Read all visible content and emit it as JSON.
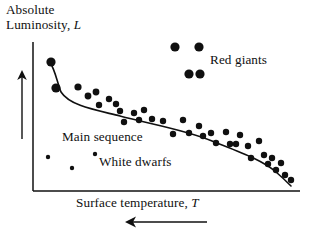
{
  "figure": {
    "kind": "hertzsprung-russell-diagram",
    "background_color": "#ffffff",
    "ink_color": "#101010"
  },
  "axes": {
    "y_title_line1": "Absolute",
    "y_title_line2": "Luminosity,",
    "y_title_symbol": "L",
    "x_title": "Surface temperature,",
    "x_title_symbol": "T",
    "y_axis_line": {
      "x": 33,
      "y1": 42,
      "y2": 191
    },
    "x_axis_line": {
      "x1": 33,
      "x2": 300,
      "y": 191
    },
    "y_direction_arrow": {
      "x": 22,
      "y_tip": 71,
      "y_tail": 139,
      "points": "up"
    },
    "x_direction_arrow": {
      "y": 222,
      "x_tip": 126,
      "x_tail": 207,
      "points": "left"
    }
  },
  "annotations": {
    "red_giants": "Red giants",
    "main_sequence": "Main sequence",
    "white_dwarfs": "White dwarfs"
  },
  "chart_data": {
    "type": "scatter",
    "title": "",
    "xlabel": "Surface temperature, T",
    "ylabel": "Absolute Luminosity, L",
    "grid": false,
    "legend": false,
    "x_axis_direction": "decreasing left-to-right (arrow points left)",
    "y_axis_direction": "increasing upward (arrow points up)",
    "xlim": [
      33,
      300
    ],
    "ylim": [
      191,
      42
    ],
    "note": "Coordinates are given in screenshot pixel space: x increases to the right, y increases downward.",
    "series": [
      {
        "name": "Main sequence",
        "marker": "filled-circle",
        "color": "#101010",
        "points": [
          {
            "x": 51,
            "y": 62,
            "r": 4.6
          },
          {
            "x": 56,
            "y": 88,
            "r": 4.6
          },
          {
            "x": 78,
            "y": 87,
            "r": 3.6
          },
          {
            "x": 88,
            "y": 96,
            "r": 3.4
          },
          {
            "x": 96,
            "y": 92,
            "r": 3.4
          },
          {
            "x": 99,
            "y": 105,
            "r": 3.2
          },
          {
            "x": 109,
            "y": 99,
            "r": 3.2
          },
          {
            "x": 116,
            "y": 104,
            "r": 3.2
          },
          {
            "x": 120,
            "y": 111,
            "r": 3.2
          },
          {
            "x": 124,
            "y": 122,
            "r": 3.2
          },
          {
            "x": 134,
            "y": 113,
            "r": 3.2
          },
          {
            "x": 139,
            "y": 120,
            "r": 3.2
          },
          {
            "x": 144,
            "y": 110,
            "r": 3.2
          },
          {
            "x": 152,
            "y": 119,
            "r": 3.2
          },
          {
            "x": 163,
            "y": 121,
            "r": 3.2
          },
          {
            "x": 173,
            "y": 134,
            "r": 3.2
          },
          {
            "x": 183,
            "y": 120,
            "r": 3.2
          },
          {
            "x": 189,
            "y": 133,
            "r": 3.2
          },
          {
            "x": 199,
            "y": 126,
            "r": 3.2
          },
          {
            "x": 203,
            "y": 136,
            "r": 3.2
          },
          {
            "x": 211,
            "y": 133,
            "r": 3.2
          },
          {
            "x": 216,
            "y": 143,
            "r": 3.2
          },
          {
            "x": 226,
            "y": 132,
            "r": 3.2
          },
          {
            "x": 230,
            "y": 144,
            "r": 3.2
          },
          {
            "x": 236,
            "y": 144,
            "r": 3.2
          },
          {
            "x": 240,
            "y": 135,
            "r": 3.2
          },
          {
            "x": 248,
            "y": 146,
            "r": 3.2
          },
          {
            "x": 251,
            "y": 158,
            "r": 3.2
          },
          {
            "x": 259,
            "y": 141,
            "r": 3.2
          },
          {
            "x": 264,
            "y": 155,
            "r": 3.2
          },
          {
            "x": 268,
            "y": 164,
            "r": 3.2
          },
          {
            "x": 272,
            "y": 158,
            "r": 3.2
          },
          {
            "x": 276,
            "y": 170,
            "r": 3.2
          },
          {
            "x": 281,
            "y": 163,
            "r": 3.2
          },
          {
            "x": 285,
            "y": 175,
            "r": 3.2
          },
          {
            "x": 291,
            "y": 180,
            "r": 3.2
          }
        ]
      },
      {
        "name": "Red giants",
        "marker": "filled-circle",
        "color": "#101010",
        "points": [
          {
            "x": 175,
            "y": 47,
            "r": 4.6
          },
          {
            "x": 199,
            "y": 47,
            "r": 4.6
          },
          {
            "x": 189,
            "y": 74,
            "r": 4.6
          },
          {
            "x": 200,
            "y": 74,
            "r": 4.6
          }
        ]
      },
      {
        "name": "White dwarfs",
        "marker": "filled-circle",
        "color": "#101010",
        "points": [
          {
            "x": 48,
            "y": 157,
            "r": 2.2
          },
          {
            "x": 95,
            "y": 154,
            "r": 2.2
          },
          {
            "x": 72,
            "y": 168,
            "r": 2.2
          }
        ]
      }
    ],
    "fit_curve": {
      "name": "Main sequence trend line",
      "color": "#101010",
      "width": 1.6,
      "path": "M 49 60 C 56 72, 57 82, 61 92 C 70 106, 96 110, 120 116 C 150 124, 186 130, 212 141 C 242 153, 262 160, 276 172 C 283 178, 287 182, 291 186"
    }
  }
}
